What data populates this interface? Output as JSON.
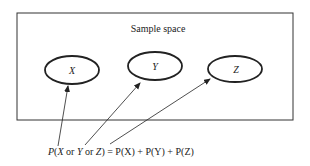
{
  "diagram": {
    "box_label": "Sample space",
    "events": [
      {
        "label": "X"
      },
      {
        "label": "Y"
      },
      {
        "label": "Z"
      }
    ],
    "formula": {
      "p1": "P(",
      "x": "X",
      "or1": " or ",
      "y": "Y",
      "or2": " or ",
      "z": "Z",
      "rhs": ") = P(X) + P(Y) + P(Z)"
    }
  }
}
